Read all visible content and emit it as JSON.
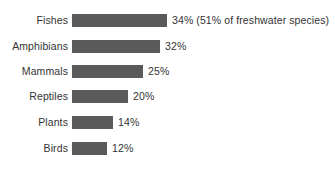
{
  "chart_data": {
    "type": "bar",
    "orientation": "horizontal",
    "title": "",
    "subtitle": "",
    "xlabel": "",
    "ylabel": "",
    "xlim": [
      0,
      34
    ],
    "grid": false,
    "legend": null,
    "bar_color": "#5a5a5a",
    "text_color": "#333333",
    "background_color": "#ffffff",
    "categories": [
      "Fishes",
      "Amphibians",
      "Mammals",
      "Reptiles",
      "Plants",
      "Birds"
    ],
    "values": [
      34,
      32,
      25,
      20,
      14,
      12
    ],
    "value_labels": [
      "34%",
      "32%",
      "25%",
      "20%",
      "14%",
      "12%"
    ],
    "annotations": [
      "(51% of freshwater species)",
      "",
      "",
      "",
      "",
      ""
    ],
    "rows": [
      {
        "category": "Fishes",
        "value": 34,
        "value_label": "34%",
        "annotation": "(51% of freshwater species)",
        "display_label": "34% (51% of freshwater species)"
      },
      {
        "category": "Amphibians",
        "value": 32,
        "value_label": "32%",
        "annotation": "",
        "display_label": "32%"
      },
      {
        "category": "Mammals",
        "value": 25,
        "value_label": "25%",
        "annotation": "",
        "display_label": "25%"
      },
      {
        "category": "Reptiles",
        "value": 20,
        "value_label": "20%",
        "annotation": "",
        "display_label": "20%"
      },
      {
        "category": "Plants",
        "value": 14,
        "value_label": "14%",
        "annotation": "",
        "display_label": "14%"
      },
      {
        "category": "Birds",
        "value": 12,
        "value_label": "12%",
        "annotation": "",
        "display_label": "12%"
      }
    ]
  },
  "layout": {
    "row_tops": [
      14,
      40,
      65,
      90,
      116,
      142
    ],
    "bar_start_x": 72,
    "bar_end_x": [
      167,
      160,
      143,
      128,
      113,
      107
    ]
  }
}
